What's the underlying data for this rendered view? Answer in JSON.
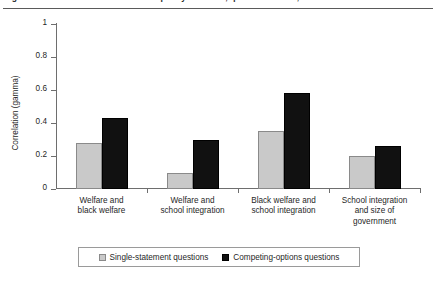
{
  "caption": {
    "text": "Figure 1. Correlations between racial policy attitudes, question format, 1990s",
    "rule": true
  },
  "chart_data": {
    "type": "bar",
    "title": "",
    "xlabel": "",
    "ylabel": "Correlation (gamma)",
    "ylim": [
      0,
      1
    ],
    "yticks": [
      0,
      0.2,
      0.4,
      0.6,
      0.8,
      1
    ],
    "ytick_labels": [
      "0",
      "0.2",
      "0.4",
      "0.6",
      "0.8",
      "1"
    ],
    "grid": false,
    "legend_position": "bottom",
    "categories": [
      "Welfare and black welfare",
      "Welfare and school integration",
      "Black welfare and school integration",
      "School integration and size of government"
    ],
    "category_lines": [
      [
        "Welfare and",
        "black welfare"
      ],
      [
        "Welfare and",
        "school integration"
      ],
      [
        "Black welfare and",
        "school integration"
      ],
      [
        "School integration",
        "and size of",
        "government"
      ]
    ],
    "series": [
      {
        "name": "Single-statement questions",
        "color": "#c9c9c9",
        "values": [
          0.28,
          0.1,
          0.35,
          0.2
        ]
      },
      {
        "name": "Competing-options questions",
        "color": "#111111",
        "values": [
          0.43,
          0.3,
          0.58,
          0.26
        ]
      }
    ]
  },
  "legend": {
    "items": [
      {
        "label": "Single-statement questions",
        "swatch": "light-gray-square"
      },
      {
        "label": "Competing-options questions",
        "swatch": "black-square"
      }
    ]
  }
}
